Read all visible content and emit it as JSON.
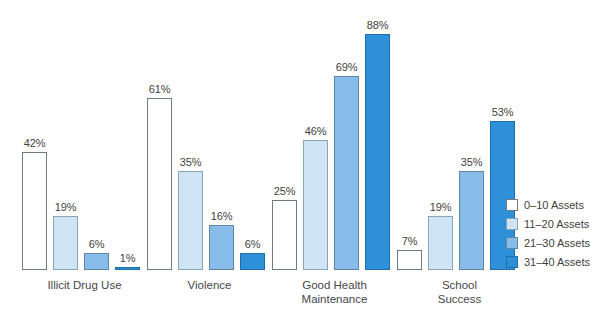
{
  "chart_data": {
    "type": "bar",
    "title": "",
    "subtitle": "",
    "xlabel": "",
    "ylabel": "",
    "ylim": [
      0,
      100
    ],
    "grid": false,
    "value_suffix": "%",
    "legend_position": "right",
    "categories": [
      "Illicit Drug Use",
      "Violence",
      "Good Health\nMaintenance",
      "School\nSuccess"
    ],
    "series": [
      {
        "name": "0–10 Assets",
        "color": "#ffffff",
        "border": "#6f7a82",
        "values": [
          42,
          61,
          25,
          7
        ],
        "labels": [
          "42%",
          "61%",
          "25%",
          "7%"
        ]
      },
      {
        "name": "11–20 Assets",
        "color": "#cfe4f4",
        "border": "#8aa4b6",
        "values": [
          19,
          35,
          46,
          19
        ],
        "labels": [
          "19%",
          "35%",
          "46%",
          "19%"
        ]
      },
      {
        "name": "21–30 Assets",
        "color": "#87bde8",
        "border": "#5f86a4",
        "values": [
          6,
          16,
          69,
          35
        ],
        "labels": [
          "6%",
          "16%",
          "69%",
          "35%"
        ]
      },
      {
        "name": "31–40 Assets",
        "color": "#2e90d9",
        "border": "#1f6ea8",
        "values": [
          1,
          6,
          88,
          53
        ],
        "labels": [
          "1%",
          "6%",
          "88%",
          "53%"
        ]
      }
    ]
  },
  "legend": {
    "items": [
      {
        "label": "0–10 Assets"
      },
      {
        "label": "11–20 Assets"
      },
      {
        "label": "21–30 Assets"
      },
      {
        "label": "31–40 Assets"
      }
    ]
  }
}
